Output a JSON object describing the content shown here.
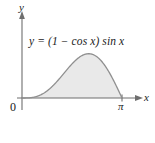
{
  "figure": {
    "background_color": "#ffffff",
    "width": 155,
    "height": 143
  },
  "equation": {
    "text": "y = (1 − cos x) sin x"
  },
  "axes": {
    "y_axis_label": "y",
    "x_axis_label": "x",
    "origin_label": "0",
    "x_tick_label": "π",
    "axis_color": "#6e6e6e"
  },
  "curve": {
    "stroke_color": "#8f8f8f",
    "fill_color": "#e9e9e9"
  },
  "chart_data": {
    "type": "area",
    "title": "",
    "subtitle": "",
    "xlabel": "x",
    "ylabel": "y",
    "annotations": [
      "y = (1 − cos x) sin x"
    ],
    "legend": [],
    "grid": false,
    "xlim": [
      0,
      3.14159
    ],
    "ylim": [
      0,
      1.6
    ],
    "xticks": [
      0,
      3.14159
    ],
    "xticklabels": [
      "0",
      "π"
    ],
    "yticks": [],
    "yticklabels": [],
    "series": [
      {
        "name": "y = (1 - cos x) sin x",
        "filled": true,
        "x": [
          0.0,
          0.15708,
          0.31416,
          0.47124,
          0.62832,
          0.7854,
          0.94248,
          1.09956,
          1.25664,
          1.41372,
          1.5708,
          1.72788,
          1.88496,
          2.04204,
          2.19911,
          2.35619,
          2.51327,
          2.67035,
          2.82743,
          2.98451,
          3.14159
        ],
        "y": [
          0.0,
          0.00193,
          0.01519,
          0.04995,
          0.11459,
          0.20711,
          0.32415,
          0.4606,
          0.60971,
          0.76336,
          0.91229,
          1.04647,
          1.15573,
          1.2303,
          1.26143,
          1.24185,
          1.16634,
          1.03213,
          0.83929,
          0.59113,
          0.0
        ]
      }
    ]
  }
}
